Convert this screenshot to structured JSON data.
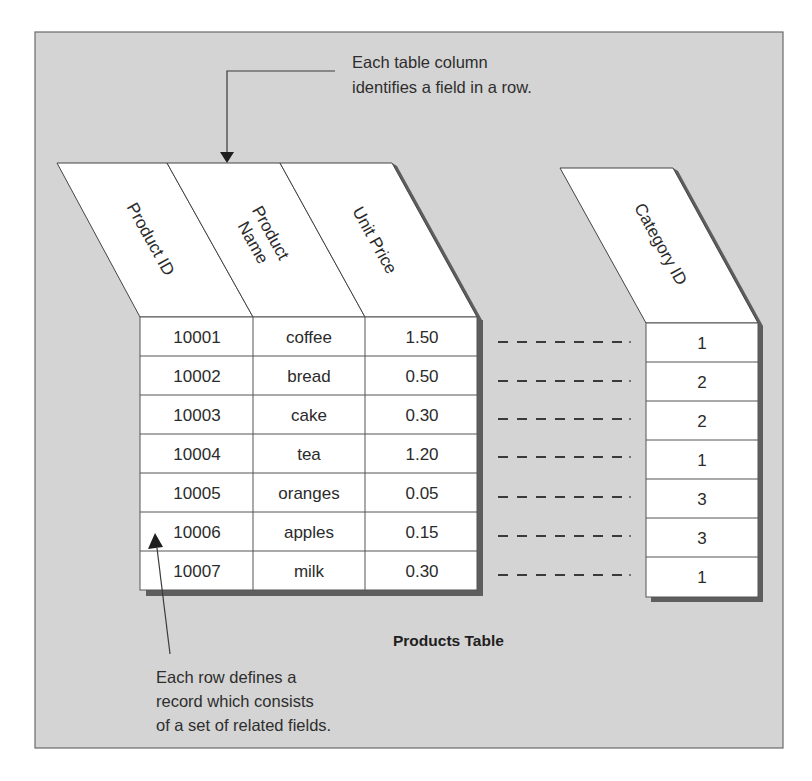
{
  "annotations": {
    "column_note": [
      "Each table column",
      "identifies a field in a row."
    ],
    "row_note": [
      "Each row defines a",
      "record which consists",
      "of a set of related fields."
    ]
  },
  "table": {
    "title": "Products Table",
    "columns": [
      {
        "label_lines": [
          "Product ID"
        ]
      },
      {
        "label_lines": [
          "Product",
          "Name"
        ]
      },
      {
        "label_lines": [
          "Unit Price"
        ]
      }
    ],
    "rows": [
      {
        "product_id": "10001",
        "product_name": "coffee",
        "unit_price": "1.50",
        "category_id": "1"
      },
      {
        "product_id": "10002",
        "product_name": "bread",
        "unit_price": "0.50",
        "category_id": "2"
      },
      {
        "product_id": "10003",
        "product_name": "cake",
        "unit_price": "0.30",
        "category_id": "2"
      },
      {
        "product_id": "10004",
        "product_name": "tea",
        "unit_price": "1.20",
        "category_id": "1"
      },
      {
        "product_id": "10005",
        "product_name": "oranges",
        "unit_price": "0.05",
        "category_id": "3"
      },
      {
        "product_id": "10006",
        "product_name": "apples",
        "unit_price": "0.15",
        "category_id": "3"
      },
      {
        "product_id": "10007",
        "product_name": "milk",
        "unit_price": "0.30",
        "category_id": "1"
      }
    ],
    "category_column": {
      "label": "Category ID"
    }
  },
  "colors": {
    "panel": "#d4d4d4",
    "cell": "#ffffff",
    "shadow": "#5e5e5e",
    "text": "#2b2b2b"
  },
  "icons": {
    "column_arrow": "arrow-down-icon",
    "row_arrow": "arrow-up-icon"
  }
}
